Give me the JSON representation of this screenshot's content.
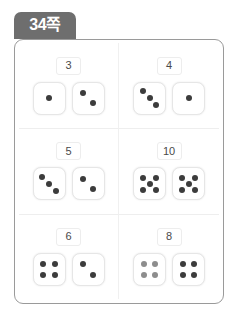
{
  "tab": {
    "label": "34쪽"
  },
  "worksheet": {
    "problems": [
      {
        "sum": "3",
        "dice": [
          {
            "pips": 1,
            "layout": "center",
            "pip_color": "#3c3c3c"
          },
          {
            "pips": 2,
            "layout": "diagonal-2",
            "pip_color": "#3c3c3c"
          }
        ]
      },
      {
        "sum": "4",
        "dice": [
          {
            "pips": 3,
            "layout": "diagonal-3",
            "pip_color": "#3c3c3c"
          },
          {
            "pips": 1,
            "layout": "center",
            "pip_color": "#3c3c3c"
          }
        ]
      },
      {
        "sum": "5",
        "dice": [
          {
            "pips": 3,
            "layout": "diagonal-3",
            "pip_color": "#3c3c3c"
          },
          {
            "pips": 2,
            "layout": "diagonal-2",
            "pip_color": "#3c3c3c"
          }
        ]
      },
      {
        "sum": "10",
        "dice": [
          {
            "pips": 5,
            "layout": "quincunx-5",
            "pip_color": "#3c3c3c"
          },
          {
            "pips": 5,
            "layout": "quincunx-5",
            "pip_color": "#3c3c3c"
          }
        ]
      },
      {
        "sum": "6",
        "dice": [
          {
            "pips": 4,
            "layout": "corners-4",
            "pip_color": "#3c3c3c"
          },
          {
            "pips": 2,
            "layout": "diagonal-2",
            "pip_color": "#3c3c3c"
          }
        ]
      },
      {
        "sum": "8",
        "dice": [
          {
            "pips": 4,
            "layout": "corners-4",
            "pip_color": "#8d8d8d"
          },
          {
            "pips": 4,
            "layout": "corners-4",
            "pip_color": "#3c3c3c"
          }
        ]
      }
    ]
  },
  "colors": {
    "tab_background": "#6e6e6e",
    "tab_text": "#ffffff",
    "card_border": "#9a9a9a",
    "pip_dark": "#3c3c3c",
    "pip_light": "#8d8d8d",
    "sum_text": "#4a4a4a"
  }
}
